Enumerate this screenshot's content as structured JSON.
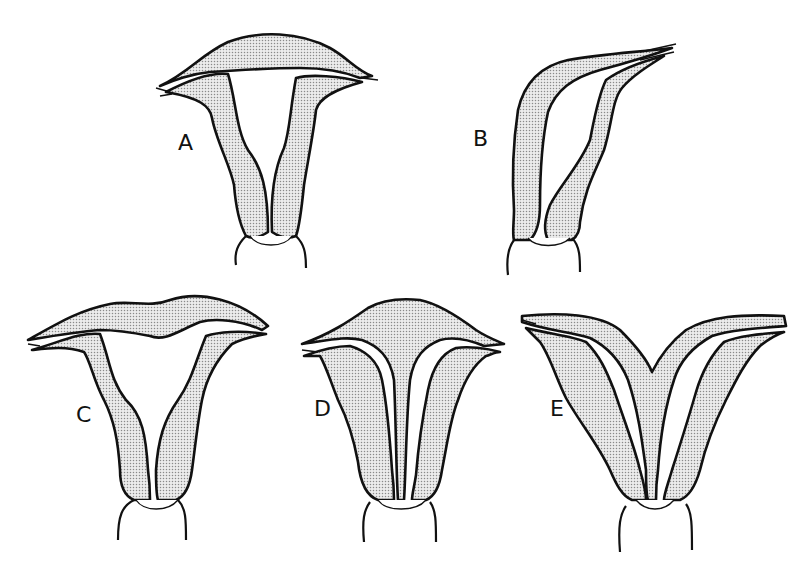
{
  "figure": {
    "panels": [
      {
        "id": "A",
        "label": "A"
      },
      {
        "id": "B",
        "label": "B"
      },
      {
        "id": "C",
        "label": "C"
      },
      {
        "id": "D",
        "label": "D"
      },
      {
        "id": "E",
        "label": "E"
      }
    ],
    "colors": {
      "outline": "#111111",
      "stipple": "#d4d4d4",
      "background": "#ffffff"
    }
  }
}
